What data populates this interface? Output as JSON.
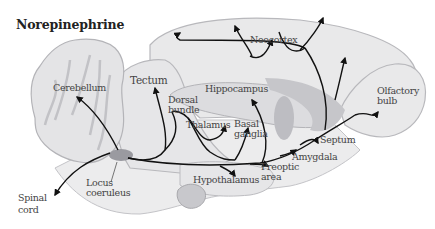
{
  "title": "Norepinephrine",
  "labels": {
    "cerebellum": "Cerebellum",
    "tectum": "Tectum",
    "dorsal_bundle_1": "Dorsal",
    "dorsal_bundle_2": "bundle",
    "hippocampus": "Hippocampus",
    "neocortex": "Neocortex",
    "olfactory_bulb_1": "Olfactory",
    "olfactory_bulb_2": "bulb",
    "thalamus": "Thalamus",
    "basal_ganglia_1": "Basal",
    "basal_ganglia_2": "ganglia",
    "septum": "Septum",
    "amygdala": "Amygdala",
    "preoptic_area_1": "Preoptic",
    "preoptic_area_2": "area",
    "hypothalamus": "Hypothalamus",
    "locus_coeruleus_1": "Locus",
    "locus_coeruleus_2": "coeruleus",
    "spinal_cord_1": "Spinal",
    "spinal_cord_2": "cord"
  },
  "colors": {
    "brain_fill": "#e9e9ea",
    "brain_outline": "#b8b8bc",
    "structure_fill": "#c8c8cc",
    "nucleus_fill": "#9a9aa0",
    "pathway": "#111111"
  }
}
